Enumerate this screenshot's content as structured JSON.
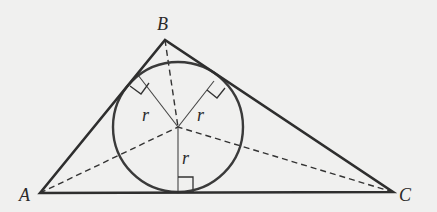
{
  "diagram": {
    "colors": {
      "background": "#f0f0ef",
      "stroke": "#333333",
      "text": "#2a2a2a"
    },
    "vertices": {
      "A": {
        "label": "A",
        "x": 40,
        "y": 193,
        "label_x": 19,
        "label_y": 201
      },
      "B": {
        "label": "B",
        "x": 165,
        "y": 40,
        "label_x": 158,
        "label_y": 30
      },
      "C": {
        "label": "C",
        "x": 393,
        "y": 192,
        "label_x": 399,
        "label_y": 201
      }
    },
    "incircle": {
      "cx": 178,
      "cy": 127,
      "r": 65
    },
    "radii": [
      {
        "label": "r",
        "to_x": 138,
        "to_y": 75,
        "label_x": 143,
        "label_y": 117
      },
      {
        "label": "r",
        "to_x": 214,
        "to_y": 81,
        "label_x": 197,
        "label_y": 117
      },
      {
        "label": "r",
        "to_x": 178,
        "to_y": 192,
        "label_x": 181,
        "label_y": 163
      }
    ],
    "bisectors": [
      "A",
      "B",
      "C"
    ],
    "right_angle_markers": 3
  }
}
